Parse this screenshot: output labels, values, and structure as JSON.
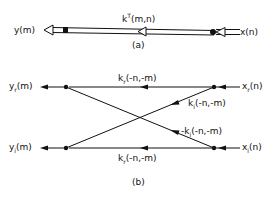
{
  "part_a": {
    "caption": "(a)",
    "output_label": "y(m)",
    "input_label": "x(n)",
    "kernel_label_base": "k",
    "kernel_label_sup": "T",
    "kernel_label_args": "(m,n)"
  },
  "part_b": {
    "caption": "(b)",
    "outputs": [
      {
        "base": "y",
        "sub": "r",
        "args": "(m)"
      },
      {
        "base": "y",
        "sub": "i",
        "args": "(m)"
      }
    ],
    "inputs": [
      {
        "base": "x",
        "sub": "r",
        "args": "(n)"
      },
      {
        "base": "x",
        "sub": "i",
        "args": "(n)"
      }
    ],
    "branches": [
      {
        "prefix": "",
        "base": "k",
        "sub": "r",
        "args": "(-n,-m)",
        "position": "top-horizontal"
      },
      {
        "prefix": "",
        "base": "k",
        "sub": "i",
        "args": "(-n,-m)",
        "position": "upper-diagonal"
      },
      {
        "prefix": "-",
        "base": "k",
        "sub": "i",
        "args": "(-n,-m)",
        "position": "lower-diagonal"
      },
      {
        "prefix": "",
        "base": "k",
        "sub": "r",
        "args": "(-n,-m)",
        "position": "bottom-horizontal"
      }
    ]
  },
  "colors": {
    "ink": "#111111",
    "background": "#ffffff"
  }
}
